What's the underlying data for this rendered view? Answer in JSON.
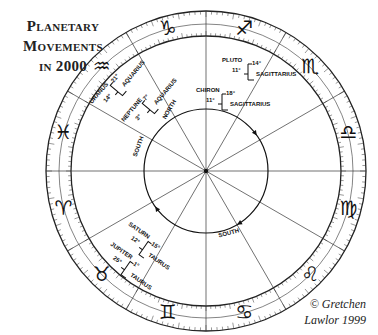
{
  "title": {
    "line1": "Planetary",
    "line2": "Movements",
    "line3": "in 2000"
  },
  "credit": {
    "line1": "© Gretchen",
    "line2": "Lawlor 1999"
  },
  "wheel": {
    "orientation": "mirrored (zodiac runs clockwise)",
    "signs": [
      {
        "name": "Capricorn",
        "glyph": "♑"
      },
      {
        "name": "Sagittarius",
        "glyph": "♐"
      },
      {
        "name": "Scorpio",
        "glyph": "♏"
      },
      {
        "name": "Libra",
        "glyph": "♎"
      },
      {
        "name": "Virgo",
        "glyph": "♍"
      },
      {
        "name": "Leo",
        "glyph": "♌"
      },
      {
        "name": "Cancer",
        "glyph": "♋"
      },
      {
        "name": "Gemini",
        "glyph": "♊"
      },
      {
        "name": "Taurus",
        "glyph": "♉"
      },
      {
        "name": "Aries",
        "glyph": "♈"
      },
      {
        "name": "Pisces",
        "glyph": "♓"
      },
      {
        "name": "Aquarius",
        "glyph": "♒"
      }
    ],
    "planet_annotations": [
      {
        "planet": "Pluto",
        "label": "PLUTO",
        "from": "11°",
        "to": "14°",
        "sign": "Sagittarius"
      },
      {
        "planet": "Chiron",
        "label": "CHIRON",
        "from": "11°",
        "to": "18°",
        "sign": "Sagittarius"
      },
      {
        "planet": "Uranus",
        "label": "URANUS",
        "from": "14°",
        "to": "21°",
        "sign": "Aquarius"
      },
      {
        "planet": "Neptune",
        "label": "NEPTUNE",
        "from": "3°",
        "to": "7°",
        "sign": "Aquarius"
      },
      {
        "planet": "Jupiter",
        "label": "JUPITER",
        "from": "25°",
        "to": "1°",
        "sign": "Taurus"
      },
      {
        "planet": "Saturn",
        "label": "SATURN",
        "from": "12°",
        "to": "15°",
        "sign": "Taurus"
      }
    ],
    "node_labels": [
      {
        "label": "SOUTH",
        "position": "inner-left"
      },
      {
        "label": "SOUTH",
        "position": "inner-bottom"
      },
      {
        "label": "NORTH",
        "position": "inner-top"
      }
    ]
  }
}
